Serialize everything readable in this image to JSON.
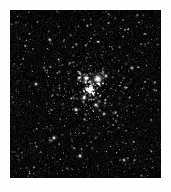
{
  "page": {
    "width": 171,
    "height": 192,
    "background_color": "#ffffff"
  },
  "image": {
    "name": "open-star-cluster",
    "type": "astronomical-photograph",
    "subject": "dense open star cluster in a crowded Milky Way star field",
    "frame": {
      "left": 10,
      "top": 10,
      "width": 151,
      "height": 168,
      "background_color": "#050505",
      "border_color": "#000000"
    },
    "palette": {
      "sky_black": "#050505",
      "faint_star": "#585858",
      "mid_star": "#a8a8a8",
      "bright_star": "#e8e8e8",
      "core_white": "#ffffff",
      "page_white": "#fefefe"
    },
    "field": {
      "total_star_count": 1500,
      "background_star_count": 1050,
      "cluster_star_count": 450,
      "cluster_center_x": 80,
      "cluster_center_y": 80,
      "cluster_radius": 46,
      "noise_grain": true,
      "noise_opacity": 0.22
    },
    "bright_stars": [
      {
        "name": "dominant-star",
        "x": 88,
        "y": 69,
        "radius": 4.6,
        "brightness": 1.0
      },
      {
        "name": "companion-star",
        "x": 76,
        "y": 68,
        "radius": 3.0,
        "brightness": 0.86
      },
      {
        "name": "upper-right-star",
        "x": 96,
        "y": 66,
        "radius": 2.2,
        "brightness": 0.72
      },
      {
        "name": "core-star-a",
        "x": 74,
        "y": 88,
        "radius": 2.4,
        "brightness": 0.8
      },
      {
        "name": "core-star-b",
        "x": 86,
        "y": 95,
        "radius": 2.3,
        "brightness": 0.78
      },
      {
        "name": "core-star-c",
        "x": 66,
        "y": 100,
        "radius": 2.1,
        "brightness": 0.74
      },
      {
        "name": "core-star-d",
        "x": 94,
        "y": 104,
        "radius": 2.0,
        "brightness": 0.7
      },
      {
        "name": "lower-left-star",
        "x": 44,
        "y": 128,
        "radius": 2.3,
        "brightness": 0.76
      },
      {
        "name": "lower-star",
        "x": 70,
        "y": 146,
        "radius": 2.2,
        "brightness": 0.74
      },
      {
        "name": "right-field-star",
        "x": 122,
        "y": 58,
        "radius": 2.0,
        "brightness": 0.68
      },
      {
        "name": "left-field-star",
        "x": 26,
        "y": 74,
        "radius": 2.1,
        "brightness": 0.7
      },
      {
        "name": "bottom-right-star",
        "x": 114,
        "y": 150,
        "radius": 2.0,
        "brightness": 0.68
      },
      {
        "name": "top-left-star",
        "x": 40,
        "y": 30,
        "radius": 1.9,
        "brightness": 0.64
      }
    ],
    "caption": ""
  }
}
